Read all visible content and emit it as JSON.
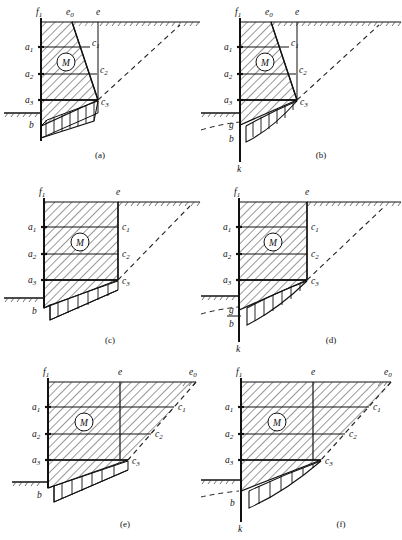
{
  "figure": {
    "panel_count": 6,
    "stroke_color": "#111111",
    "hatch_color": "#333333",
    "dash_color": "#222222"
  },
  "labels": {
    "f1": "f",
    "f1_sub": "1",
    "e": "e",
    "e0": "e",
    "e0_sub": "0",
    "a1": "a",
    "a1_sub": "1",
    "a2": "a",
    "a2_sub": "2",
    "a3": "a",
    "a3_sub": "3",
    "c1": "c",
    "c1_sub": "1",
    "c2": "c",
    "c2_sub": "2",
    "c3": "c",
    "c3_sub": "3",
    "M": "M",
    "b": "b",
    "g": "g",
    "k": "k"
  },
  "panels": [
    {
      "id": "a",
      "caption": "(a)",
      "wall_shape": "battered",
      "base_curve": "straight",
      "has_e0": true,
      "has_g": false,
      "has_k": false,
      "anchor_style": "vertical-strut",
      "points": [
        "f1",
        "e0",
        "e",
        "a1",
        "a2",
        "a3",
        "c1",
        "c2",
        "c3",
        "b",
        "M"
      ]
    },
    {
      "id": "b",
      "caption": "(b)",
      "wall_shape": "battered",
      "base_curve": "curved",
      "has_e0": true,
      "has_g": true,
      "has_k": true,
      "anchor_style": "vertical-strut",
      "points": [
        "f1",
        "e0",
        "e",
        "a1",
        "a2",
        "a3",
        "c1",
        "c2",
        "c3",
        "g",
        "b",
        "k",
        "M"
      ]
    },
    {
      "id": "c",
      "caption": "(c)",
      "wall_shape": "vertical",
      "base_curve": "straight",
      "has_e0": false,
      "has_g": false,
      "has_k": false,
      "anchor_style": "none",
      "points": [
        "f1",
        "e",
        "a1",
        "a2",
        "a3",
        "c1",
        "c2",
        "c3",
        "b",
        "M"
      ]
    },
    {
      "id": "d",
      "caption": "(d)",
      "wall_shape": "vertical",
      "base_curve": "curved",
      "has_e0": false,
      "has_g": true,
      "has_k": true,
      "anchor_style": "none",
      "points": [
        "f1",
        "e",
        "a1",
        "a2",
        "a3",
        "c1",
        "c2",
        "c3",
        "g",
        "b",
        "k",
        "M"
      ]
    },
    {
      "id": "e",
      "caption": "(e)",
      "wall_shape": "vertical",
      "base_curve": "straight",
      "has_e0": true,
      "has_g": false,
      "has_k": false,
      "anchor_style": "inclined-tierods",
      "points": [
        "f1",
        "e",
        "e0",
        "a1",
        "a2",
        "a3",
        "c1",
        "c2",
        "c3",
        "b",
        "M"
      ]
    },
    {
      "id": "f",
      "caption": "(f)",
      "wall_shape": "vertical",
      "base_curve": "curved",
      "has_e0": true,
      "has_g": false,
      "has_k": true,
      "anchor_style": "inclined-tierods",
      "points": [
        "f1",
        "e",
        "e0",
        "a1",
        "a2",
        "a3",
        "c1",
        "c2",
        "c3",
        "b",
        "k",
        "M"
      ]
    }
  ]
}
